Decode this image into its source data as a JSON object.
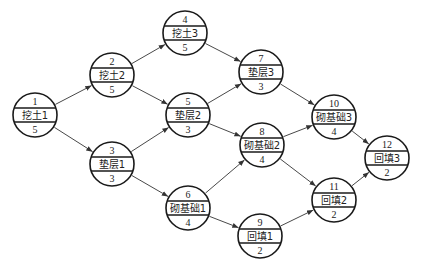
{
  "diagram": {
    "type": "activity-on-node network",
    "nodes": [
      {
        "id": "1",
        "name": "挖土1",
        "duration": "5",
        "x": 35,
        "y": 115
      },
      {
        "id": "2",
        "name": "挖土2",
        "duration": "5",
        "x": 112,
        "y": 75
      },
      {
        "id": "3",
        "name": "垫层1",
        "duration": "3",
        "x": 112,
        "y": 164
      },
      {
        "id": "4",
        "name": "挖土3",
        "duration": "5",
        "x": 185,
        "y": 33
      },
      {
        "id": "5",
        "name": "垫层2",
        "duration": "3",
        "x": 188,
        "y": 115
      },
      {
        "id": "6",
        "name": "砌基础1",
        "duration": "4",
        "x": 188,
        "y": 208
      },
      {
        "id": "7",
        "name": "垫层3",
        "duration": "3",
        "x": 261,
        "y": 72
      },
      {
        "id": "8",
        "name": "砌基础2",
        "duration": "4",
        "x": 262,
        "y": 145
      },
      {
        "id": "9",
        "name": "回填1",
        "duration": "2",
        "x": 260,
        "y": 236
      },
      {
        "id": "10",
        "name": "砌基础3",
        "duration": "4",
        "x": 334,
        "y": 117
      },
      {
        "id": "11",
        "name": "回填2",
        "duration": "2",
        "x": 334,
        "y": 200
      },
      {
        "id": "12",
        "name": "回填3",
        "duration": "2",
        "x": 387,
        "y": 158
      }
    ],
    "edges": [
      [
        "1",
        "2"
      ],
      [
        "1",
        "3"
      ],
      [
        "2",
        "4"
      ],
      [
        "2",
        "5"
      ],
      [
        "3",
        "5"
      ],
      [
        "3",
        "6"
      ],
      [
        "4",
        "7"
      ],
      [
        "5",
        "7"
      ],
      [
        "5",
        "8"
      ],
      [
        "6",
        "8"
      ],
      [
        "6",
        "9"
      ],
      [
        "7",
        "10"
      ],
      [
        "8",
        "10"
      ],
      [
        "8",
        "11"
      ],
      [
        "9",
        "11"
      ],
      [
        "10",
        "12"
      ],
      [
        "11",
        "12"
      ]
    ],
    "node_radius": 22,
    "colors": {
      "stroke": "#1a1a1a",
      "edge": "#333333",
      "background": "#ffffff"
    }
  }
}
